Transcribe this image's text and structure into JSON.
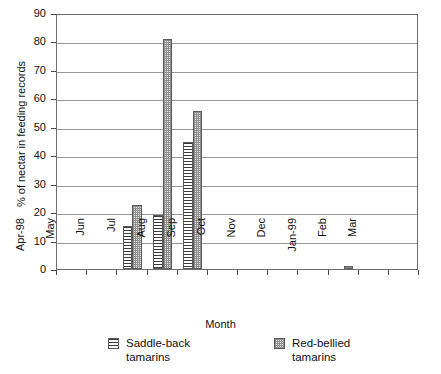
{
  "chart_data": {
    "type": "bar",
    "title": "",
    "xlabel": "Month",
    "ylabel": "% of nectar in feeding records",
    "ylim": [
      0,
      90
    ],
    "ytick_step": 10,
    "yticks": [
      90,
      80,
      70,
      60,
      50,
      40,
      30,
      20,
      10,
      0
    ],
    "grid": true,
    "legend_position": "bottom",
    "categories": [
      "Apr-98",
      "May",
      "Jun",
      "Jul",
      "Aug",
      "Sep",
      "Oct",
      "Nov",
      "Dec",
      "Jan-99",
      "Feb",
      "Mar"
    ],
    "series": [
      {
        "name": "Saddle-back tamarins",
        "pattern": "horizontal-lines",
        "values": [
          0,
          0,
          15,
          19,
          44.5,
          0,
          0,
          0,
          0,
          0,
          0,
          0
        ]
      },
      {
        "name": "Red-bellied tamarins",
        "pattern": "dotted-grid",
        "values": [
          0,
          0,
          22.5,
          81,
          55.5,
          0,
          0,
          0,
          0,
          1,
          0,
          0
        ]
      }
    ]
  },
  "legend": {
    "items": [
      {
        "label_line1": "Saddle-back",
        "label_line2": "tamarins",
        "swatch": "horizontal-lines-swatch"
      },
      {
        "label_line1": "Red-bellied",
        "label_line2": "tamarins",
        "swatch": "dotted-grid-swatch"
      }
    ]
  },
  "axes": {
    "x_title": "Month",
    "y_title": "% of nectar in feeding records"
  },
  "colors": {
    "frame": "#6d6d6d",
    "gridline": "#9a9a9a",
    "text": "#111111",
    "saddle_fill": "#ffffff",
    "saddle_line": "#3a3a3a",
    "red_fill": "#e9e9e9",
    "red_line": "#8e8e8e",
    "background": "#ffffff"
  }
}
